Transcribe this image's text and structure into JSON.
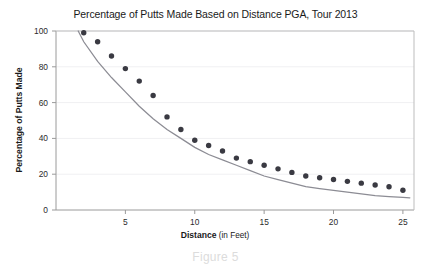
{
  "chart_data": {
    "type": "scatter",
    "title": "Percentage of Putts Made Based on Distance PGA, Tour 2013",
    "xlabel_bold": "Distance",
    "xlabel_rest": " (in Feet)",
    "ylabel": "Percentage of Putts Made",
    "caption": "Figure 5",
    "xlim": [
      0,
      25.8
    ],
    "ylim": [
      0,
      100
    ],
    "xticks": [
      5,
      10,
      15,
      20,
      25
    ],
    "yticks": [
      0,
      20,
      40,
      60,
      80,
      100
    ],
    "xtick_labels": [
      "5",
      "10",
      "15",
      "20",
      "25"
    ],
    "ytick_labels": [
      "0",
      "20",
      "40",
      "60",
      "80",
      "100"
    ],
    "grid": "horizontal",
    "legend": "none",
    "point_color": "#3a3a42",
    "curve_color": "#8c8c94",
    "grid_color": "#f0f0f2",
    "axis_color": "#9a9a9a",
    "x": [
      2,
      3,
      4,
      5,
      6,
      7,
      8,
      9,
      10,
      11,
      12,
      13,
      14,
      15,
      16,
      17,
      18,
      19,
      20,
      21,
      22,
      23,
      24,
      25
    ],
    "y": [
      99,
      94,
      86,
      79,
      72,
      64,
      52,
      45,
      39,
      36,
      33,
      29,
      27,
      25,
      23,
      21,
      19,
      18,
      17,
      16,
      15,
      14,
      13,
      11
    ],
    "series": [
      {
        "name": "Percentage of putts made",
        "kind": "scatter",
        "values": [
          99,
          94,
          86,
          79,
          72,
          64,
          52,
          45,
          39,
          36,
          33,
          29,
          27,
          25,
          23,
          21,
          19,
          18,
          17,
          16,
          15,
          14,
          13,
          11
        ]
      },
      {
        "name": "Fitted exponential decay curve",
        "kind": "line",
        "model": "y = 124.5 * e^(-0.104 * x)",
        "x": [
          1.6,
          2,
          3,
          4,
          5,
          6,
          7,
          8,
          9,
          10,
          11,
          12,
          13,
          14,
          15,
          16,
          17,
          18,
          19,
          20,
          21,
          22,
          23,
          24,
          25,
          25.5
        ],
        "values": [
          100,
          94,
          83,
          74,
          66,
          58,
          51,
          45,
          40,
          35,
          31,
          28,
          25,
          22,
          19,
          17,
          15,
          13,
          12,
          11,
          10,
          9,
          8,
          7.5,
          7,
          6.8
        ]
      }
    ]
  }
}
